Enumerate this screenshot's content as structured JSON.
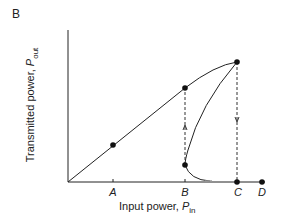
{
  "panel_label": "B",
  "axes": {
    "x_label": "Input power, ",
    "x_symbol": "P",
    "x_sub": "in",
    "y_label": "Transmitted power, ",
    "y_symbol": "P",
    "y_sub": "out"
  },
  "ticks": [
    {
      "label": "A",
      "x": 113
    },
    {
      "label": "B",
      "x": 185
    },
    {
      "label": "C",
      "x": 238
    },
    {
      "label": "D",
      "x": 262
    }
  ],
  "points": [
    {
      "name": "A",
      "x": 113,
      "y": 145
    },
    {
      "name": "B-upper",
      "x": 185,
      "y": 88
    },
    {
      "name": "C-upper",
      "x": 237,
      "y": 62
    },
    {
      "name": "B-lower",
      "x": 185,
      "y": 165
    },
    {
      "name": "C-lower",
      "x": 237,
      "y": 182
    },
    {
      "name": "D",
      "x": 262,
      "y": 182
    }
  ],
  "colors": {
    "line": "#222222",
    "dashed": "#333333"
  }
}
